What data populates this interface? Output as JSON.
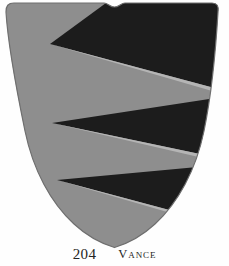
{
  "plate": {
    "background_color": "#fefefe",
    "number": "204",
    "name": "Vance"
  },
  "shield": {
    "label": "heraldic-shield",
    "blazon_note": "Paly pily / per pale indented of six, sable and grey",
    "field_color": "#8e8e8e",
    "charge_color": "#1c1c1c",
    "outline_color": "#6f6f6f",
    "highlight_color": "#bdbdbd",
    "notch_label": "top-center-notch"
  },
  "colors": {
    "grey": "#8e8e8e",
    "sable": "#1c1c1c",
    "paper": "#fefefe",
    "ink": "#242424"
  }
}
